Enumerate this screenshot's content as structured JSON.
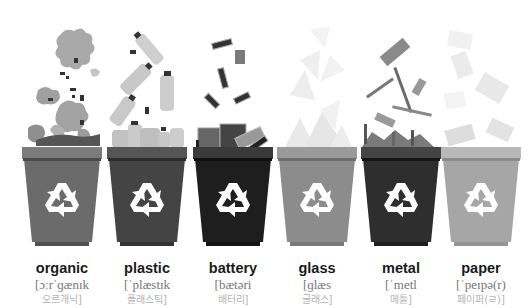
{
  "bins": [
    {
      "id": "organic",
      "word": "organic",
      "phonetic": "[ɔːrˈɡænɪk",
      "korean": "오르개닉]",
      "bin_color": "#6b6b6b",
      "rim_color": "#7c7c7c",
      "band_color": "#4a4a4a",
      "base_color": "#505050"
    },
    {
      "id": "plastic",
      "word": "plastic",
      "phonetic": "[ˈplæstɪk",
      "korean": "플래스틱]",
      "bin_color": "#444444",
      "rim_color": "#555555",
      "band_color": "#2a2a2a",
      "base_color": "#333333"
    },
    {
      "id": "battery",
      "word": "battery",
      "phonetic": "[bætəri",
      "korean": "배터리]",
      "bin_color": "#1e1e1e",
      "rim_color": "#3a3a3a",
      "band_color": "#0f0f0f",
      "base_color": "#151515"
    },
    {
      "id": "glass",
      "word": "glass",
      "phonetic": "[ɡlæs",
      "korean": "글래스]",
      "bin_color": "#8c8c8c",
      "rim_color": "#9a9a9a",
      "band_color": "#6e6e6e",
      "base_color": "#7a7a7a"
    },
    {
      "id": "metal",
      "word": "metal",
      "phonetic": "[ˈmetl",
      "korean": "메틀]",
      "bin_color": "#2e2e2e",
      "rim_color": "#444444",
      "band_color": "#151515",
      "base_color": "#1f1f1f"
    },
    {
      "id": "paper",
      "word": "paper",
      "phonetic": "[ˈpeɪpə(r)",
      "korean": "페이퍼(ㄹ)]",
      "bin_color": "#a6a6a6",
      "rim_color": "#b8b8b8",
      "band_color": "#8c8c8c",
      "base_color": "#959595"
    }
  ],
  "icons": {
    "recycle": "recycle-icon"
  }
}
